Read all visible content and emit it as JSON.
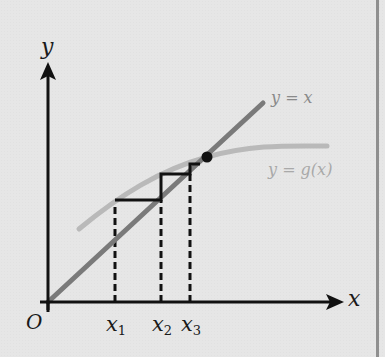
{
  "diagram": {
    "title": "",
    "type": "fixed-point staircase iteration",
    "axes": {
      "x_label": "x",
      "y_label": "y",
      "origin_label": "O"
    },
    "curves": {
      "identity": {
        "label": "y = x",
        "color": "#7a7a7a"
      },
      "g": {
        "label": "y = g(x)",
        "color": "#b9b9b9"
      }
    },
    "ticks": [
      {
        "name": "x",
        "sub": "1"
      },
      {
        "name": "x",
        "sub": "2"
      },
      {
        "name": "x",
        "sub": "3"
      }
    ],
    "fixed_point": {
      "marker": "filled-circle",
      "color": "#111111"
    },
    "colors": {
      "background": "#e6e6e6",
      "axis": "#111111",
      "staircase": "#111111",
      "frame_border": "#8f8f8f"
    }
  }
}
